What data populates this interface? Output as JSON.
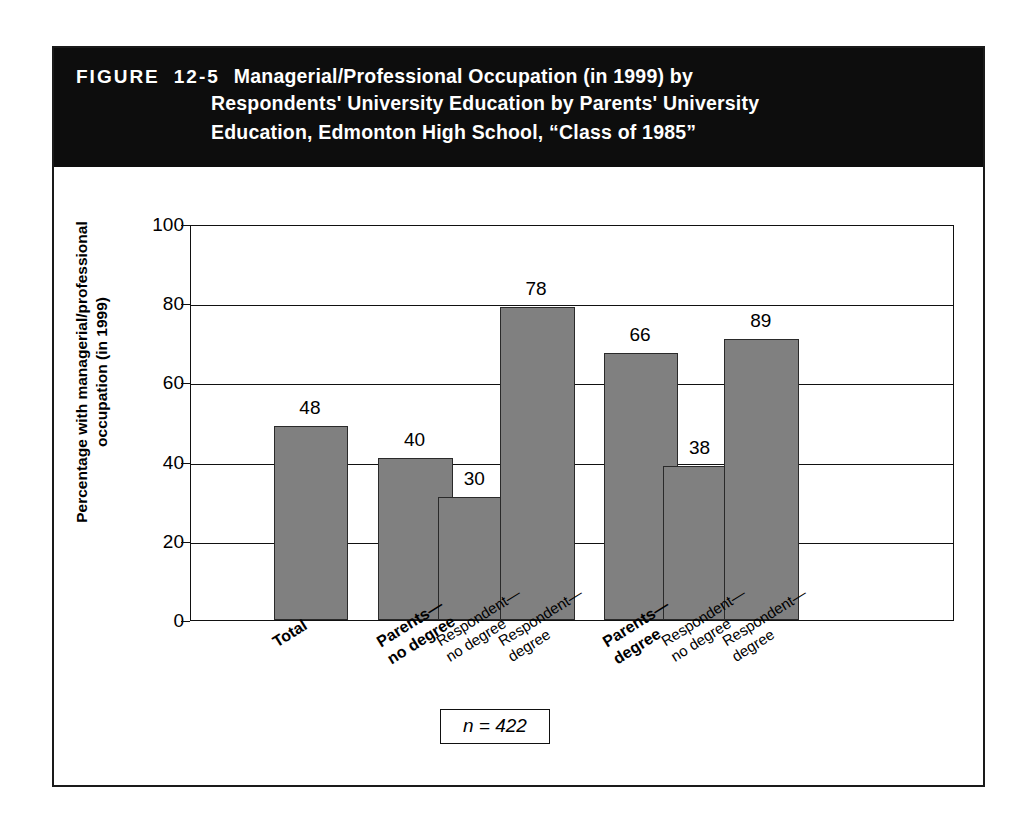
{
  "figure": {
    "label": "FIGURE",
    "number": "12-5",
    "title_line_1": "Managerial/Professional Occupation (in 1999) by",
    "title_line_2": "Respondents' University Education by Parents' University",
    "title_line_3": "Education, Edmonton High School, “Class of 1985”",
    "band_color": "#0d0d0d",
    "band_text_color": "#ffffff"
  },
  "annotation": {
    "n_label": "n = 422"
  },
  "chart_data": {
    "type": "bar",
    "title": "Managerial/Professional Occupation (in 1999) by Respondents' University Education by Parents' University Education, Edmonton High School, “Class of 1985”",
    "xlabel": "",
    "ylabel": "Percentage with managerial/professional occupation (in 1999)",
    "ylabel_line_1": "Percentage with managerial/professional",
    "ylabel_line_2": "occupation (in 1999)",
    "ylim": [
      0,
      100
    ],
    "yticks": [
      0,
      20,
      40,
      60,
      80,
      100
    ],
    "ytick_labels": [
      "0",
      "20",
      "40",
      "60",
      "80",
      "100"
    ],
    "grid": true,
    "legend": "none",
    "bar_color": "#808080",
    "bar_edge_color": "#2a2a2a",
    "categories": [
      "Total",
      "Parents—no degree",
      "Respondent—no degree",
      "Respondent—degree",
      "Parents—degree",
      "Respondent—no degree",
      "Respondent—degree"
    ],
    "values": [
      48,
      40,
      30,
      78,
      66,
      38,
      89
    ],
    "bars": [
      {
        "label_line_1": "Total",
        "label_line_2": "",
        "bold": true,
        "value": 48,
        "value_text": "48",
        "x_pct": 10.8,
        "width_pct": 9.8,
        "drawn_pct": 49
      },
      {
        "label_line_1": "Parents—",
        "label_line_2": "no degree",
        "bold": true,
        "value": 40,
        "value_text": "40",
        "x_pct": 24.5,
        "width_pct": 9.8,
        "drawn_pct": 41
      },
      {
        "label_line_1": "Respondent—",
        "label_line_2": "no degree",
        "bold": false,
        "value": 30,
        "value_text": "30",
        "x_pct": 32.3,
        "width_pct": 9.8,
        "drawn_pct": 31
      },
      {
        "label_line_1": "Respondent—",
        "label_line_2": "degree",
        "bold": false,
        "value": 78,
        "value_text": "78",
        "x_pct": 40.4,
        "width_pct": 9.8,
        "drawn_pct": 79
      },
      {
        "label_line_1": "Parents—",
        "label_line_2": "degree",
        "bold": true,
        "value": 66,
        "value_text": "66",
        "x_pct": 54.0,
        "width_pct": 9.8,
        "drawn_pct": 67.5
      },
      {
        "label_line_1": "Respondent—",
        "label_line_2": "no degree",
        "bold": false,
        "value": 38,
        "value_text": "38",
        "x_pct": 61.8,
        "width_pct": 9.8,
        "drawn_pct": 39
      },
      {
        "label_line_1": "Respondent—",
        "label_line_2": "degree",
        "bold": false,
        "value": 89,
        "value_text": "89",
        "x_pct": 69.8,
        "width_pct": 9.8,
        "drawn_pct": 71
      }
    ]
  }
}
